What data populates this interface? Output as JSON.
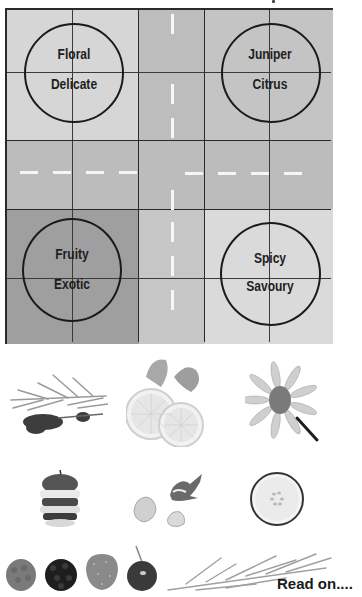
{
  "diagram": {
    "type": "flavour-quadrant-map",
    "quadrants": [
      {
        "id": "top-left",
        "line1": "Floral",
        "line2": "Delicate"
      },
      {
        "id": "top-right",
        "line1": "Juniper",
        "line2": "Citrus"
      },
      {
        "id": "bottom-left",
        "line1": "Fruity",
        "line2": "Exotic"
      },
      {
        "id": "bottom-right",
        "line1": "Spicy",
        "line2": "Savoury"
      }
    ],
    "colors": {
      "top_left": "#d6d6d6",
      "top_center": "#bdbdbd",
      "top_right": "#c4c4c4",
      "middle_row": "#bcbcbc",
      "bottom_left": "#9f9f9f",
      "bottom_center": "#c6c6c6",
      "bottom_right": "#dadada",
      "grid_line": "#2a2a2a",
      "dash": "#f6f6f6"
    }
  },
  "images": {
    "row1": [
      {
        "name": "rosemary-lavender-sprig"
      },
      {
        "name": "lemon-slices-with-mint"
      },
      {
        "name": "daisy-flower"
      }
    ],
    "row2": [
      {
        "name": "sliced-apple"
      },
      {
        "name": "ginger-and-garlic"
      },
      {
        "name": "cucumber-slice"
      }
    ],
    "row3": [
      {
        "name": "raspberry"
      },
      {
        "name": "blackberry"
      },
      {
        "name": "strawberry"
      },
      {
        "name": "cherry"
      },
      {
        "name": "rosemary-sprigs"
      }
    ]
  },
  "footer": {
    "read_on": "Read on...."
  }
}
